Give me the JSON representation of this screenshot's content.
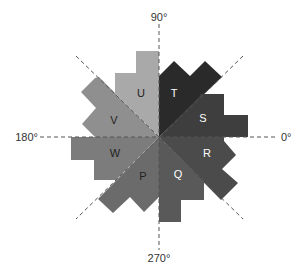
{
  "diagram": {
    "type": "rose-diagram",
    "center": [
      159,
      137
    ],
    "axis_labels": {
      "deg_0": "0°",
      "deg_90": "90°",
      "deg_180": "180°",
      "deg_270": "270°"
    },
    "segments": [
      {
        "id": "T",
        "label": "T",
        "color": "#2a2a2a",
        "text_color": "#ffffff",
        "points": "159,137 159,76 174,61 190,76 205,61 222,77 159,137",
        "label_pos": [
          174,
          97
        ]
      },
      {
        "id": "S",
        "label": "S",
        "color": "#3e3e3e",
        "text_color": "#ffffff",
        "points": "159,137 200,96 200,94 224,94 224,115 248,115 248,137",
        "label_pos": [
          203,
          122
        ]
      },
      {
        "id": "R",
        "label": "R",
        "color": "#4b4b4b",
        "text_color": "#ffffff",
        "points": "159,137 224,137 224,141 236,155 222,169 238,183 224,197 221,200",
        "label_pos": [
          207,
          157
        ]
      },
      {
        "id": "Q",
        "label": "Q",
        "color": "#595959",
        "text_color": "#ffffff",
        "points": "159,137 204,182 204,200 181,200 181,222 159,222",
        "label_pos": [
          178,
          178
        ]
      },
      {
        "id": "P",
        "label": "P",
        "color": "#6b6b6b",
        "text_color": "#222222",
        "points": "159,137 159,197 144,212 130,197 113,213 98,199",
        "label_pos": [
          143,
          180
        ]
      },
      {
        "id": "W",
        "label": "W",
        "color": "#7c7c7c",
        "text_color": "#222222",
        "points": "159,137 71,137 71,160 94,160 94,180 116,180",
        "label_pos": [
          115,
          157
        ]
      },
      {
        "id": "V",
        "label": "V",
        "color": "#8f8f8f",
        "text_color": "#222222",
        "points": "159,137 95,137 82,124 96,108 81,92 95,78 99,77",
        "label_pos": [
          114,
          124
        ]
      },
      {
        "id": "U",
        "label": "U",
        "color": "#a9a9a9",
        "text_color": "#222222",
        "points": "159,137 116,94 115,94 115,73 136,73 136,51 159,51",
        "label_pos": [
          141,
          97
        ]
      }
    ]
  }
}
